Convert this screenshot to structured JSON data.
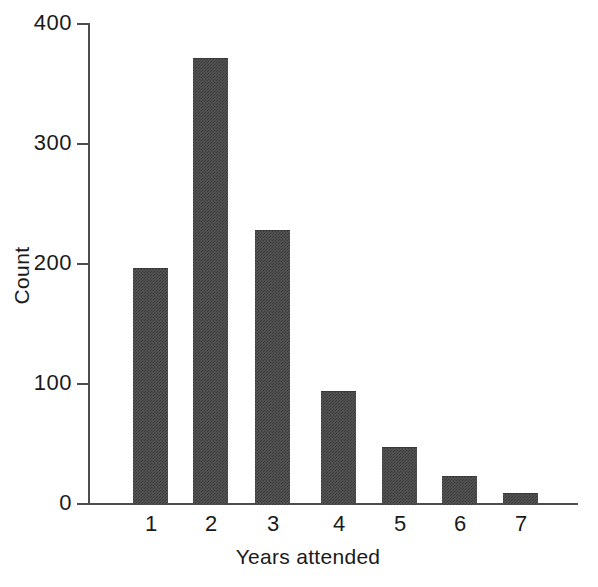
{
  "chart_data": {
    "type": "bar",
    "title": "",
    "subtitle": "",
    "xlabel": "Years attended",
    "ylabel": "Count",
    "categories": [
      "1",
      "2",
      "3",
      "4",
      "5",
      "6",
      "7"
    ],
    "values": [
      196,
      371,
      228,
      94,
      47,
      23,
      9
    ],
    "series": [
      {
        "name": "Count",
        "values": [
          196,
          371,
          228,
          94,
          47,
          23,
          9
        ]
      }
    ],
    "ylim": [
      0,
      400
    ],
    "yticks": [
      0,
      100,
      200,
      300,
      400
    ],
    "ytick_labels": [
      "0",
      "100",
      "200",
      "300",
      "400"
    ],
    "xtick_labels": [
      "1",
      "2",
      "3",
      "4",
      "5",
      "6",
      "7"
    ],
    "grid": false,
    "legend": null,
    "legend_position": "none",
    "bar_color": "#555555",
    "axis_color": "#4d4d4d",
    "background_color": "#ffffff",
    "annotations": []
  },
  "axes": {
    "y_title": "Count",
    "x_title": "Years attended"
  }
}
